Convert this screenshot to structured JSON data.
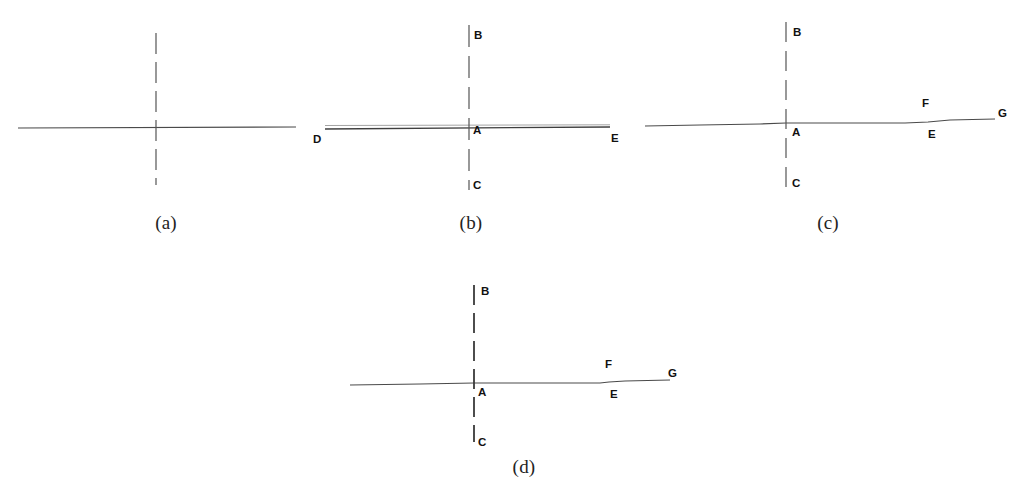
{
  "figure": {
    "background_color": "#ffffff",
    "line_color": "#4a4a4a",
    "dash_color": "#555555",
    "label_color": "#111111",
    "caption_color": "#232323",
    "panels": [
      {
        "id": "panel-a",
        "caption": "(a)",
        "caption_x": 166,
        "caption_y": 212,
        "horizontal_line": {
          "x1": 18,
          "y1": 128,
          "x2": 296,
          "y2": 127
        },
        "vertical_dashed_line": {
          "x": 156,
          "y1": 33,
          "y2": 185
        },
        "point_labels": []
      },
      {
        "id": "panel-b",
        "caption": "(b)",
        "caption_x": 471,
        "caption_y": 212,
        "horizontal_line": {
          "x1": 325,
          "y1": 129,
          "x2": 610,
          "y2": 127
        },
        "horizontal_line_secondary": {
          "x1": 325,
          "y1": 126,
          "x2": 610,
          "y2": 125
        },
        "vertical_dashed_line": {
          "x": 469,
          "y1": 25,
          "y2": 190
        },
        "point_labels": [
          {
            "text": "B",
            "x": 474,
            "y": 29
          },
          {
            "text": "A",
            "x": 473,
            "y": 124
          },
          {
            "text": "C",
            "x": 473,
            "y": 179
          },
          {
            "text": "D",
            "x": 313,
            "y": 133
          },
          {
            "text": "E",
            "x": 611,
            "y": 132
          }
        ]
      },
      {
        "id": "panel-c",
        "caption": "(c)",
        "caption_x": 828,
        "caption_y": 212,
        "polyline": "645,126 700,125 760,124 786,123 860,123 905,123 928,122 950,120 995,119",
        "vertical_dashed_line": {
          "x": 786,
          "y1": 22,
          "y2": 188
        },
        "point_labels": [
          {
            "text": "B",
            "x": 793,
            "y": 26
          },
          {
            "text": "A",
            "x": 792,
            "y": 126
          },
          {
            "text": "C",
            "x": 792,
            "y": 177
          },
          {
            "text": "F",
            "x": 922,
            "y": 97
          },
          {
            "text": "E",
            "x": 928,
            "y": 128
          },
          {
            "text": "G",
            "x": 998,
            "y": 107
          }
        ]
      },
      {
        "id": "panel-d",
        "caption": "(d)",
        "caption_x": 524,
        "caption_y": 456,
        "polyline": "350,385 420,384 474,383 540,383 600,383 609,382 625,381 670,380",
        "vertical_dashed_line": {
          "x": 474,
          "y1": 285,
          "y2": 442
        },
        "point_labels": [
          {
            "text": "B",
            "x": 481,
            "y": 285
          },
          {
            "text": "A",
            "x": 478,
            "y": 386
          },
          {
            "text": "C",
            "x": 478,
            "y": 436
          },
          {
            "text": "F",
            "x": 605,
            "y": 358
          },
          {
            "text": "E",
            "x": 610,
            "y": 388
          },
          {
            "text": "G",
            "x": 668,
            "y": 367
          }
        ]
      }
    ]
  }
}
